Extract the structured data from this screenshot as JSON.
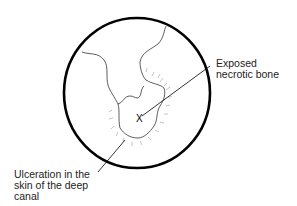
{
  "diagram": {
    "labels": {
      "bone": [
        "Exposed",
        "necrotic bone"
      ],
      "ulceration": [
        "Ulceration in the",
        "skin of the deep",
        "canal"
      ]
    },
    "marker": "X",
    "colors": {
      "stroke": "#000000",
      "fine": "#333333",
      "hatch": "#aaaaaa"
    }
  }
}
